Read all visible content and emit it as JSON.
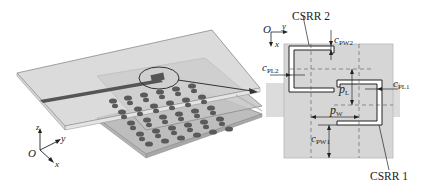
{
  "figure": {
    "left_panel": {
      "description": "3D view of stacked substrate layers with microstrip line and metasurface unit array",
      "axes": {
        "origin": "O",
        "x": "x",
        "y": "y",
        "z": "z"
      }
    },
    "right_panel": {
      "description": "Top view of unit cell with two complementary split-ring resonators",
      "axes": {
        "origin": "O",
        "x": "x",
        "y": "y"
      },
      "labels": {
        "csrr2": "CSRR 2",
        "csrr1": "CSRR 1",
        "c_pw2_main": "c",
        "c_pw2_sub": "PW2",
        "c_pl2_main": "c",
        "c_pl2_sub": "PL2",
        "c_pl1_main": "c",
        "c_pl1_sub": "PL1",
        "p_l_main": "p",
        "p_l_sub": "L",
        "p_w_main": "p",
        "p_w_sub": "W",
        "c_pw1_main": "c",
        "c_pw1_sub": "PW1"
      }
    },
    "colors": {
      "substrate": "#c9c9c9",
      "substrate_edge": "#8a8a8a",
      "metal": "#555555",
      "unit_square": "#d6d6d6",
      "line": "#222222"
    }
  }
}
